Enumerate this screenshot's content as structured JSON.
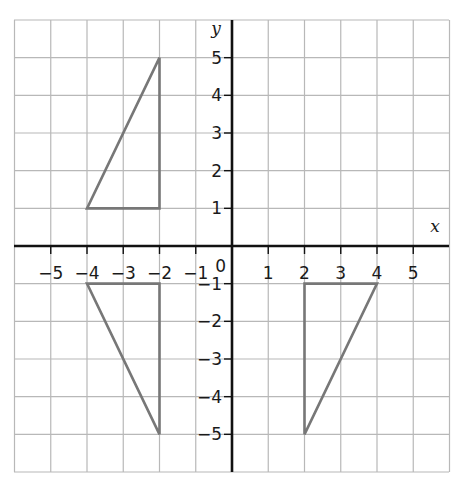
{
  "diagram": {
    "type": "coordinate-grid",
    "x_axis": {
      "label": "x",
      "range": [
        -6,
        6
      ],
      "tick_labels": [
        "−5",
        "−4",
        "−3",
        "−2",
        "−1",
        "1",
        "2",
        "3",
        "4",
        "5"
      ],
      "tick_values": [
        -5,
        -4,
        -3,
        -2,
        -1,
        1,
        2,
        3,
        4,
        5
      ]
    },
    "y_axis": {
      "label": "y",
      "range": [
        -6,
        6
      ],
      "tick_labels": [
        "5",
        "4",
        "3",
        "2",
        "1",
        "−1",
        "−2",
        "−3",
        "−4",
        "−5"
      ],
      "tick_values": [
        5,
        4,
        3,
        2,
        1,
        -1,
        -2,
        -3,
        -4,
        -5
      ]
    },
    "origin_label": "0",
    "colors": {
      "grid": "#b8b8b8",
      "axis": "#111111",
      "shape": "#777777"
    },
    "shapes": [
      {
        "name": "triangle-A",
        "vertices": [
          [
            -4,
            1
          ],
          [
            -2,
            1
          ],
          [
            -2,
            5
          ]
        ]
      },
      {
        "name": "triangle-B",
        "vertices": [
          [
            -4,
            -1
          ],
          [
            -2,
            -1
          ],
          [
            -2,
            -5
          ]
        ]
      },
      {
        "name": "triangle-C",
        "vertices": [
          [
            2,
            -1
          ],
          [
            4,
            -1
          ],
          [
            2,
            -5
          ]
        ]
      }
    ]
  }
}
